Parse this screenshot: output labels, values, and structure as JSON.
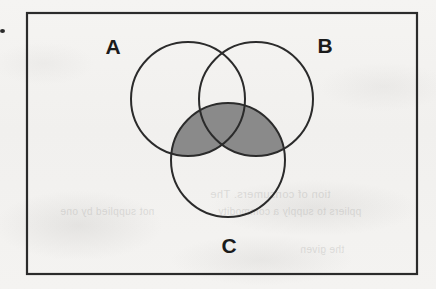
{
  "figure": {
    "kind": "venn-diagram",
    "title": "",
    "universe_border_color": "#2b2b2b",
    "background_color": "#f3f2f0",
    "circle_stroke_color": "#2b2b2b",
    "shade_color": "#8a8a8a",
    "shaded_description": "C intersect (A union B)",
    "labels": {
      "a": "A",
      "b": "B",
      "c": "C"
    },
    "sets": [
      {
        "name": "A",
        "label": "A",
        "cx": 188,
        "cy": 99,
        "r": 57
      },
      {
        "name": "B",
        "label": "B",
        "cx": 256,
        "cy": 99,
        "r": 57
      },
      {
        "name": "C",
        "label": "C",
        "cx": 228,
        "cy": 160,
        "r": 57
      }
    ],
    "universe_rect": {
      "x": 26,
      "y": 12,
      "width": 392,
      "height": 263
    },
    "regions": [
      {
        "id": "A-only",
        "shaded": false
      },
      {
        "id": "B-only",
        "shaded": false
      },
      {
        "id": "C-only",
        "shaded": false
      },
      {
        "id": "A-and-B",
        "shaded": false
      },
      {
        "id": "A-and-C",
        "shaded": true
      },
      {
        "id": "B-and-C",
        "shaded": true
      },
      {
        "id": "A-and-B-and-C",
        "shaded": true
      },
      {
        "id": "outside",
        "shaded": false
      }
    ]
  },
  "artifacts": {
    "edge_dot": "scan-speck",
    "ghost_text_lines": [
      "tion of consumers. The",
      "ppliers to supply a commodity",
      "not supplied by one",
      "the given"
    ]
  }
}
